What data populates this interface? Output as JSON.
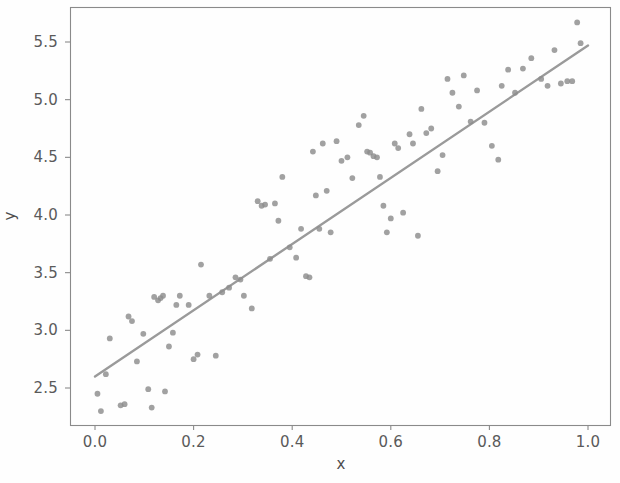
{
  "chart_data": {
    "type": "scatter",
    "title": "",
    "xlabel": "x",
    "ylabel": "y",
    "xlim": [
      -0.05,
      1.04
    ],
    "ylim": [
      2.22,
      5.79
    ],
    "grid": false,
    "legend": null,
    "point_color": "#8c8c8c",
    "line_color": "#9a9a9a",
    "frame_color": "#8a8a8a",
    "xticks": [
      0.0,
      0.2,
      0.4,
      0.6,
      0.8,
      1.0
    ],
    "xticklabels": [
      "0.0",
      "0.2",
      "0.4",
      "0.6",
      "0.8",
      "1.0"
    ],
    "yticks": [
      2.5,
      3.0,
      3.5,
      4.0,
      4.5,
      5.0,
      5.5
    ],
    "yticklabels": [
      "2.5",
      "3.0",
      "3.5",
      "4.0",
      "4.5",
      "5.0",
      "5.5"
    ],
    "series": [
      {
        "name": "observations",
        "type": "scatter",
        "marker": "circle",
        "points": [
          [
            0.005,
            2.45
          ],
          [
            0.012,
            2.3
          ],
          [
            0.022,
            2.62
          ],
          [
            0.03,
            2.93
          ],
          [
            0.052,
            2.35
          ],
          [
            0.06,
            2.36
          ],
          [
            0.068,
            3.12
          ],
          [
            0.075,
            3.08
          ],
          [
            0.085,
            2.73
          ],
          [
            0.098,
            2.97
          ],
          [
            0.108,
            2.49
          ],
          [
            0.115,
            2.33
          ],
          [
            0.12,
            3.29
          ],
          [
            0.128,
            3.26
          ],
          [
            0.133,
            3.28
          ],
          [
            0.138,
            3.3
          ],
          [
            0.142,
            2.47
          ],
          [
            0.15,
            2.86
          ],
          [
            0.158,
            2.98
          ],
          [
            0.165,
            3.22
          ],
          [
            0.172,
            3.3
          ],
          [
            0.19,
            3.22
          ],
          [
            0.2,
            2.75
          ],
          [
            0.208,
            2.79
          ],
          [
            0.215,
            3.57
          ],
          [
            0.232,
            3.3
          ],
          [
            0.245,
            2.78
          ],
          [
            0.258,
            3.33
          ],
          [
            0.272,
            3.37
          ],
          [
            0.285,
            3.46
          ],
          [
            0.295,
            3.44
          ],
          [
            0.302,
            3.3
          ],
          [
            0.318,
            3.19
          ],
          [
            0.33,
            4.12
          ],
          [
            0.338,
            4.08
          ],
          [
            0.345,
            4.09
          ],
          [
            0.355,
            3.62
          ],
          [
            0.365,
            4.1
          ],
          [
            0.372,
            3.95
          ],
          [
            0.38,
            4.33
          ],
          [
            0.395,
            3.72
          ],
          [
            0.408,
            3.63
          ],
          [
            0.418,
            3.88
          ],
          [
            0.428,
            3.47
          ],
          [
            0.435,
            3.46
          ],
          [
            0.442,
            4.55
          ],
          [
            0.448,
            4.17
          ],
          [
            0.455,
            3.88
          ],
          [
            0.462,
            4.62
          ],
          [
            0.47,
            4.21
          ],
          [
            0.478,
            3.85
          ],
          [
            0.49,
            4.64
          ],
          [
            0.5,
            4.47
          ],
          [
            0.512,
            4.5
          ],
          [
            0.522,
            4.32
          ],
          [
            0.535,
            4.78
          ],
          [
            0.545,
            4.86
          ],
          [
            0.552,
            4.55
          ],
          [
            0.558,
            4.54
          ],
          [
            0.565,
            4.51
          ],
          [
            0.572,
            4.5
          ],
          [
            0.578,
            4.33
          ],
          [
            0.585,
            4.08
          ],
          [
            0.592,
            3.85
          ],
          [
            0.6,
            3.97
          ],
          [
            0.608,
            4.62
          ],
          [
            0.615,
            4.58
          ],
          [
            0.625,
            4.02
          ],
          [
            0.638,
            4.7
          ],
          [
            0.645,
            4.62
          ],
          [
            0.655,
            3.82
          ],
          [
            0.662,
            4.92
          ],
          [
            0.672,
            4.71
          ],
          [
            0.682,
            4.75
          ],
          [
            0.695,
            4.38
          ],
          [
            0.705,
            4.52
          ],
          [
            0.715,
            5.18
          ],
          [
            0.725,
            5.06
          ],
          [
            0.738,
            4.94
          ],
          [
            0.748,
            5.21
          ],
          [
            0.762,
            4.81
          ],
          [
            0.775,
            5.08
          ],
          [
            0.79,
            4.8
          ],
          [
            0.805,
            4.6
          ],
          [
            0.818,
            4.48
          ],
          [
            0.825,
            5.12
          ],
          [
            0.838,
            5.26
          ],
          [
            0.852,
            5.06
          ],
          [
            0.868,
            5.27
          ],
          [
            0.885,
            5.36
          ],
          [
            0.905,
            5.18
          ],
          [
            0.918,
            5.12
          ],
          [
            0.932,
            5.43
          ],
          [
            0.945,
            5.14
          ],
          [
            0.958,
            5.16
          ],
          [
            0.968,
            5.16
          ],
          [
            0.978,
            5.67
          ],
          [
            0.985,
            5.49
          ]
        ]
      },
      {
        "name": "fitted-line",
        "type": "line",
        "x": [
          0.0,
          1.0
        ],
        "y": [
          2.6,
          5.47
        ]
      }
    ]
  },
  "axes": {
    "x_title": "x",
    "y_title": "y"
  }
}
